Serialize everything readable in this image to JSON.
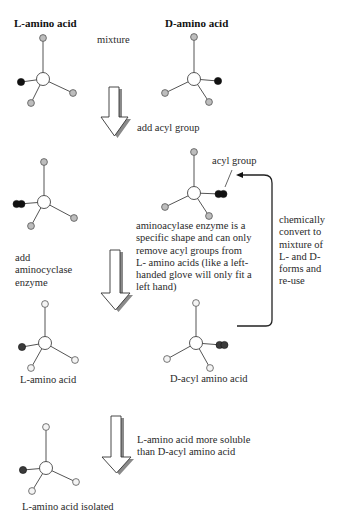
{
  "titles": {
    "l_amino_acid": "L-amino acid",
    "d_amino_acid": "D-amino acid"
  },
  "labels": {
    "mixture": "mixture",
    "add_acyl_group": "add acyl group",
    "acyl_group": "acyl group",
    "add_enzyme": [
      "add",
      "aminocyclase",
      "enzyme"
    ],
    "enzyme_explanation": [
      "aminoacylase enzyme is a",
      "specific shape and can only",
      "remove acyl groups from",
      "L- amino acids (like a left-",
      "handed glove will only fit a",
      "left hand)"
    ],
    "recycle": [
      "chemically",
      "convert to",
      "mixture of",
      "L- and D-",
      "forms and",
      "re-use"
    ],
    "l_amino_acid_product": "L-amino acid",
    "d_acyl_amino_acid": "D-acyl amino acid",
    "solubility": [
      "L-amino acid more soluble",
      "than D-acyl amino acid"
    ],
    "l_isolated": "L-amino acid isolated"
  },
  "colors": {
    "bond": "#555555",
    "grey_sphere": "#bdbdbd",
    "white_sphere": "#f4f4f4",
    "black_sphere": "#111111",
    "dark_sphere": "#3a3a3a",
    "arrow_shadow": "#8a8a8a"
  },
  "molecules": [
    {
      "name": "l-amino-acid-start",
      "center": [
        43,
        79
      ],
      "sub_fill": "grey",
      "subs": [
        {
          "xy": [
            43,
            38
          ],
          "type": "sub"
        },
        {
          "xy": [
            21,
            82
          ],
          "type": "black"
        },
        {
          "xy": [
            31,
            103
          ],
          "type": "sub"
        },
        {
          "xy": [
            73,
            93
          ],
          "type": "sub"
        }
      ]
    },
    {
      "name": "d-amino-acid-start",
      "center": [
        194,
        79
      ],
      "sub_fill": "grey",
      "subs": [
        {
          "xy": [
            194,
            37
          ],
          "type": "sub"
        },
        {
          "xy": [
            218,
            81
          ],
          "type": "black"
        },
        {
          "xy": [
            165,
            93
          ],
          "type": "sub"
        },
        {
          "xy": [
            209,
            102
          ],
          "type": "sub"
        }
      ]
    },
    {
      "name": "l-acyl-amino-acid",
      "center": [
        44,
        202
      ],
      "sub_fill": "grey",
      "subs": [
        {
          "xy": [
            44,
            162
          ],
          "type": "sub"
        },
        {
          "xy": [
            19,
            204
          ],
          "type": "acyl-left"
        },
        {
          "xy": [
            31,
            226
          ],
          "type": "sub"
        },
        {
          "xy": [
            74,
            218
          ],
          "type": "sub"
        }
      ]
    },
    {
      "name": "d-acyl-amino-acid-top",
      "center": [
        194,
        193
      ],
      "sub_fill": "grey",
      "subs": [
        {
          "xy": [
            194,
            152
          ],
          "type": "sub"
        },
        {
          "xy": [
            221,
            194
          ],
          "type": "acyl-right"
        },
        {
          "xy": [
            165,
            207
          ],
          "type": "sub"
        },
        {
          "xy": [
            209,
            216
          ],
          "type": "sub"
        }
      ]
    },
    {
      "name": "l-amino-acid-product",
      "center": [
        45,
        343
      ],
      "sub_fill": "white",
      "subs": [
        {
          "xy": [
            45,
            304
          ],
          "type": "sub"
        },
        {
          "xy": [
            22,
            347
          ],
          "type": "dark"
        },
        {
          "xy": [
            31,
            368
          ],
          "type": "sub"
        },
        {
          "xy": [
            75,
            360
          ],
          "type": "sub"
        }
      ]
    },
    {
      "name": "d-acyl-amino-acid-product",
      "center": [
        196,
        343
      ],
      "sub_fill": "white",
      "subs": [
        {
          "xy": [
            196,
            303
          ],
          "type": "sub"
        },
        {
          "xy": [
            222,
            345
          ],
          "type": "acyl-right-dark"
        },
        {
          "xy": [
            167,
            359
          ],
          "type": "sub"
        },
        {
          "xy": [
            210,
            368
          ],
          "type": "sub"
        }
      ]
    },
    {
      "name": "l-amino-acid-isolated",
      "center": [
        46,
        468
      ],
      "sub_fill": "white",
      "subs": [
        {
          "xy": [
            46,
            427
          ],
          "type": "sub"
        },
        {
          "xy": [
            23,
            470
          ],
          "type": "dark"
        },
        {
          "xy": [
            32,
            491
          ],
          "type": "sub"
        },
        {
          "xy": [
            76,
            482
          ],
          "type": "sub"
        }
      ]
    }
  ],
  "arrows": [
    {
      "name": "add-acyl-arrow",
      "shaft": [
        109,
        119
      ],
      "top": 87,
      "head_y": 117,
      "head_x": [
        101,
        128
      ],
      "tip_y": 136
    },
    {
      "name": "add-enzyme-arrow",
      "shaft": [
        110,
        120
      ],
      "top": 250,
      "head_y": 293,
      "head_x": [
        101,
        130
      ],
      "tip_y": 310
    },
    {
      "name": "separation-arrow",
      "shaft": [
        111,
        121
      ],
      "top": 416,
      "head_y": 457,
      "head_x": [
        102,
        131
      ],
      "tip_y": 473
    }
  ]
}
